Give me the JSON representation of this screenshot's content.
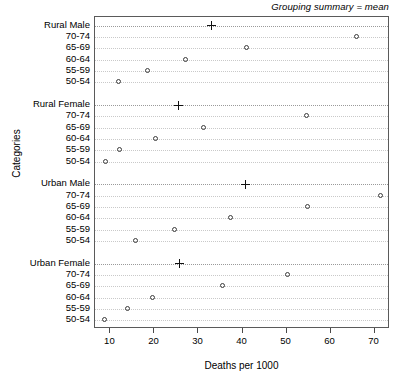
{
  "chart_data": {
    "type": "scatter",
    "title": "Grouping summary = mean",
    "xlabel": "Deaths per 1000",
    "ylabel": "Categories",
    "xlim": [
      6.5,
      73.5
    ],
    "xticks": [
      10,
      20,
      30,
      40,
      50,
      60,
      70
    ],
    "xticklabels": [
      "10",
      "20",
      "30",
      "40",
      "50",
      "60",
      "70"
    ],
    "grid": true,
    "legend": "none",
    "marker_open_circle": "open-circle",
    "marker_summary": "plus",
    "groups": [
      {
        "label": "Rural Male",
        "summary_label": "Rural Male",
        "summary_value": 32.9,
        "categories": [
          "70-74",
          "65-69",
          "60-64",
          "55-59",
          "50-54"
        ],
        "values": [
          66.0,
          41.0,
          27.2,
          18.6,
          12.0
        ]
      },
      {
        "label": "Rural Female",
        "summary_label": "Rural Female",
        "summary_value": 25.4,
        "categories": [
          "70-74",
          "65-69",
          "60-64",
          "55-59",
          "50-54"
        ],
        "values": [
          54.6,
          31.2,
          20.3,
          12.2,
          9.0
        ]
      },
      {
        "label": "Urban Male",
        "summary_label": "Urban Male",
        "summary_value": 40.6,
        "categories": [
          "70-74",
          "65-69",
          "60-64",
          "55-59",
          "50-54"
        ],
        "values": [
          71.4,
          54.8,
          37.3,
          24.7,
          15.8
        ]
      },
      {
        "label": "Urban Female",
        "summary_label": "Urban Female",
        "summary_value": 25.6,
        "categories": [
          "70-74",
          "65-69",
          "60-64",
          "55-59",
          "50-54"
        ],
        "values": [
          50.3,
          35.5,
          19.7,
          14.0,
          8.7
        ]
      }
    ],
    "colors": {
      "frame": "#5a5a5a",
      "grid": "#c9c9c9",
      "group_grid": "#9a9a9a",
      "marker": "#3b3b3b",
      "summary_marker": "#111111",
      "background": "#ffffff",
      "text": "#000000"
    }
  }
}
